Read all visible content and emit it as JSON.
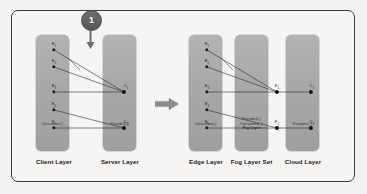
{
  "diagram": {
    "step_badge": "1",
    "colors": {
      "column_fill": "#a9a9a9",
      "frame_border": "#3a3a3a",
      "background": "#f3f2f0",
      "node": "#141414",
      "badge_fill": "#5e5e5e",
      "arrow": "#8d8d8d"
    },
    "left_group": {
      "columns": [
        {
          "id": "client-layer",
          "caption": "Client Layer",
          "role_lines": [
            "Consumes(.)"
          ],
          "italic_line": "",
          "nodes": [
            {
              "id": "n1",
              "label": "E",
              "sub": "1"
            },
            {
              "id": "n2",
              "label": "E",
              "sub": "2"
            },
            {
              "id": "n3",
              "label": "E",
              "sub": "3"
            },
            {
              "id": "n4",
              "label": "E",
              "sub": "4"
            },
            {
              "id": "n5",
              "label": "E",
              "sub": "5"
            }
          ]
        },
        {
          "id": "server-layer",
          "caption": "Server Layer",
          "role_lines": [
            "Provides(.)"
          ],
          "italic_line": "",
          "nodes": [
            {
              "id": "s1",
              "label": "C",
              "sub": "1"
            },
            {
              "id": "s2",
              "label": "C",
              "sub": "2"
            }
          ]
        }
      ]
    },
    "transform_arrow": {
      "name": "transform-arrow",
      "direction": "right"
    },
    "right_group": {
      "columns": [
        {
          "id": "edge-layer",
          "caption": "Edge Layer",
          "role_lines": [
            "Consumes(.)"
          ],
          "italic_line": "",
          "nodes": [
            {
              "id": "e1",
              "label": "E",
              "sub": "1"
            },
            {
              "id": "e2",
              "label": "E",
              "sub": "2"
            },
            {
              "id": "e3",
              "label": "E",
              "sub": "3"
            },
            {
              "id": "e4",
              "label": "E",
              "sub": "4"
            },
            {
              "id": "e5",
              "label": "E",
              "sub": "5"
            }
          ]
        },
        {
          "id": "fog-layer-set",
          "caption": "Fog Layer Set",
          "role_lines": [
            "Provides(.)",
            "Consumes(.')"
          ],
          "italic_line": "Fog Layer",
          "nodes": [
            {
              "id": "f1",
              "label": "F",
              "sub": "1"
            },
            {
              "id": "f2",
              "label": "F",
              "sub": "2"
            }
          ]
        },
        {
          "id": "cloud-layer",
          "caption": "Cloud Layer",
          "role_lines": [
            "Provides(.')"
          ],
          "italic_line": "",
          "nodes": [
            {
              "id": "c1",
              "label": "C",
              "sub": "1"
            },
            {
              "id": "c2",
              "label": "C",
              "sub": "2"
            }
          ]
        }
      ]
    }
  }
}
